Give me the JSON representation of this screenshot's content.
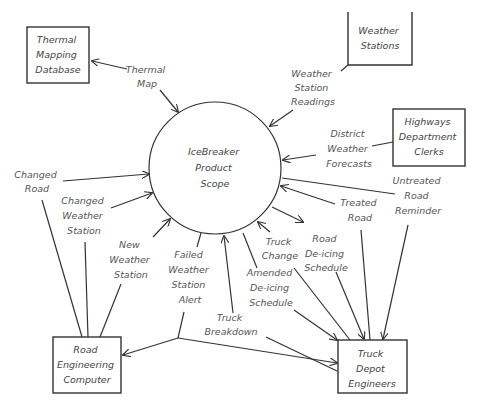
{
  "diagram": {
    "type": "context-diagram",
    "scope": {
      "label": [
        "IceBreaker",
        "Product",
        "Scope"
      ]
    },
    "entities": [
      {
        "id": "thermal",
        "label": [
          "Thermal",
          "Mapping",
          "Database"
        ]
      },
      {
        "id": "weather",
        "label": [
          "Weather",
          "Stations"
        ]
      },
      {
        "id": "highways",
        "label": [
          "Highways",
          "Department",
          "Clerks"
        ]
      },
      {
        "id": "road",
        "label": [
          "Road",
          "Engineering",
          "Computer"
        ]
      },
      {
        "id": "truck",
        "label": [
          "Truck",
          "Depot",
          "Engineers"
        ]
      }
    ],
    "flows": [
      {
        "id": "thermal-map",
        "label": [
          "Thermal",
          "Map"
        ],
        "from": "thermal",
        "to": "scope",
        "bidirectional": true
      },
      {
        "id": "weather-readings",
        "label": [
          "Weather",
          "Station",
          "Readings"
        ],
        "from": "weather",
        "to": "scope"
      },
      {
        "id": "district-forecasts",
        "label": [
          "District",
          "Weather",
          "Forecasts"
        ],
        "from": "highways",
        "to": "scope"
      },
      {
        "id": "changed-road",
        "label": [
          "Changed",
          "Road"
        ],
        "from": "road",
        "to": "scope"
      },
      {
        "id": "changed-station",
        "label": [
          "Changed",
          "Weather",
          "Station"
        ],
        "from": "road",
        "to": "scope"
      },
      {
        "id": "new-station",
        "label": [
          "New",
          "Weather",
          "Station"
        ],
        "from": "road",
        "to": "scope"
      },
      {
        "id": "failed-alert",
        "label": [
          "Failed",
          "Weather",
          "Station",
          "Alert"
        ],
        "from": "scope",
        "to": [
          "road",
          "truck"
        ]
      },
      {
        "id": "truck-breakdown",
        "label": [
          "Truck",
          "Breakdown"
        ],
        "from": "truck",
        "to": "scope"
      },
      {
        "id": "amended-schedule",
        "label": [
          "Amended",
          "De-icing",
          "Schedule"
        ],
        "from": "scope",
        "to": "truck"
      },
      {
        "id": "truck-change",
        "label": [
          "Truck",
          "Change"
        ],
        "from": "truck",
        "to": "scope"
      },
      {
        "id": "road-schedule",
        "label": [
          "Road",
          "De-icing",
          "Schedule"
        ],
        "from": "scope",
        "to": "truck"
      },
      {
        "id": "treated-road",
        "label": [
          "Treated",
          "Road"
        ],
        "from": "truck",
        "to": "scope"
      },
      {
        "id": "untreated-reminder",
        "label": [
          "Untreated",
          "Road",
          "Reminder"
        ],
        "from": "scope",
        "to": "truck"
      }
    ]
  }
}
